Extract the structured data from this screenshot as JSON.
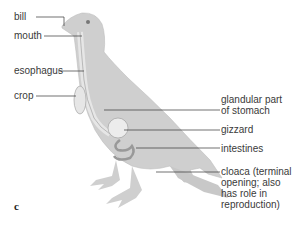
{
  "figure": {
    "panel_label": "c",
    "labels_left": [
      {
        "text": "bill"
      },
      {
        "text": "mouth"
      },
      {
        "text": "esophagus"
      },
      {
        "text": "crop"
      }
    ],
    "labels_right": [
      {
        "line1": "glandular part",
        "line2": "of stomach"
      },
      {
        "text": "gizzard"
      },
      {
        "text": "intestines"
      },
      {
        "line1": "cloaca (terminal",
        "line2": "opening; also",
        "line3": "has role in",
        "line4": "reproduction)"
      }
    ],
    "colors": {
      "body": "#cfcfcf",
      "organ": "#e6e6e6",
      "line": "#333333",
      "text": "#3a3a3a"
    }
  }
}
